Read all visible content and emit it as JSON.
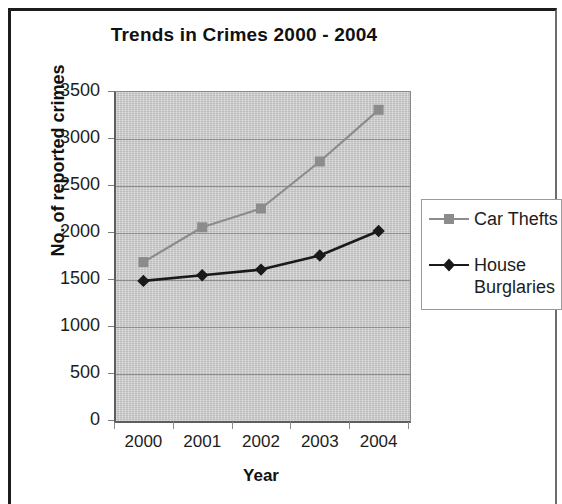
{
  "chart_data": {
    "type": "line",
    "title": "Trends in Crimes 2000 - 2004",
    "xlabel": "Year",
    "ylabel": "No. of reported crimes",
    "categories": [
      "2000",
      "2001",
      "2002",
      "2003",
      "2004"
    ],
    "x": [
      2000,
      2001,
      2002,
      2003,
      2004
    ],
    "series": [
      {
        "name": "Car Thefts",
        "values": [
          1680,
          2050,
          2250,
          2750,
          3300
        ],
        "color": "#8c8c8c",
        "marker": "square",
        "marker_color": "#8c8c8c"
      },
      {
        "name": "House Burglaries",
        "values": [
          1480,
          1540,
          1600,
          1750,
          2010
        ],
        "color": "#1a1a1a",
        "marker": "diamond",
        "marker_color": "#1a1a1a"
      }
    ],
    "ylim": [
      0,
      3500
    ],
    "yticks": [
      "0",
      "500",
      "1000",
      "1500",
      "2000",
      "2500",
      "3000",
      "3500"
    ],
    "ytick_values": [
      0,
      500,
      1000,
      1500,
      2000,
      2500,
      3000,
      3500
    ],
    "grid": true,
    "grid_axis": "y",
    "legend_position": "right",
    "plot_background": "#c9c9c9",
    "figure_background": "#ffffff"
  },
  "legend": {
    "entries": [
      {
        "label": "Car Thefts"
      },
      {
        "label": "House Burglaries"
      }
    ]
  }
}
